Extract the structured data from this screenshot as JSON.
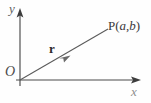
{
  "figure": {
    "background_color": "#fefefe",
    "axis_color": "#4a4a4a",
    "vector_color": "#5a5a5a",
    "label_color": "#2e2e2e",
    "labels": {
      "y_axis": "y",
      "x_axis": "x",
      "origin": "O",
      "vector": "r",
      "point_name": "P",
      "point_open_paren": "(",
      "point_coord_x": "a",
      "point_comma": ",",
      "point_coord_y": "b",
      "point_close_paren": ")",
      "point_full": "P(a,b)"
    },
    "geometry": {
      "origin_px": [
        20,
        80
      ],
      "y_axis_top_px": [
        20,
        12
      ],
      "x_axis_right_px": [
        138,
        80
      ],
      "vector_tip_px": [
        108,
        29
      ],
      "vector_midpoint_arrow_px": [
        66,
        58
      ]
    }
  }
}
